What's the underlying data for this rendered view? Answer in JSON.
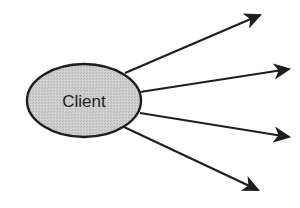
{
  "diagram": {
    "type": "fan-out",
    "nodes": [
      {
        "id": "client",
        "label": "Client",
        "shape": "ellipse",
        "cx": 84,
        "cy": 100.5,
        "rx": 57,
        "ry": 36.5,
        "fill": "#c9c9c9",
        "stroke": "#1e1e1e"
      }
    ],
    "edges": [
      {
        "from": "client",
        "x1": 125,
        "y1": 73,
        "x2": 260,
        "y2": 15
      },
      {
        "from": "client",
        "x1": 140,
        "y1": 92,
        "x2": 289,
        "y2": 69
      },
      {
        "from": "client",
        "x1": 140,
        "y1": 113,
        "x2": 289,
        "y2": 137
      },
      {
        "from": "client",
        "x1": 124,
        "y1": 127,
        "x2": 258,
        "y2": 190
      }
    ],
    "colors": {
      "line": "#1e1e1e",
      "ellipse_fill": "#c9c9c9",
      "background": "#ffffff"
    }
  }
}
